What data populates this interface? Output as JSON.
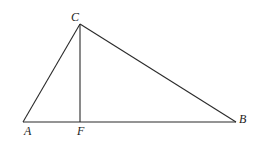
{
  "diagram": {
    "type": "geometry-triangle",
    "points": {
      "A": {
        "label": "A",
        "x": 23,
        "y": 122,
        "lx": 24,
        "ly": 135
      },
      "B": {
        "label": "B",
        "x": 236,
        "y": 122,
        "lx": 239,
        "ly": 123
      },
      "C": {
        "label": "C",
        "x": 80,
        "y": 24,
        "lx": 71,
        "ly": 21
      },
      "F": {
        "label": "F",
        "x": 80,
        "y": 122,
        "lx": 77,
        "ly": 135
      }
    },
    "segments": [
      {
        "from": "A",
        "to": "B"
      },
      {
        "from": "A",
        "to": "C"
      },
      {
        "from": "C",
        "to": "B"
      },
      {
        "from": "C",
        "to": "F"
      }
    ]
  }
}
